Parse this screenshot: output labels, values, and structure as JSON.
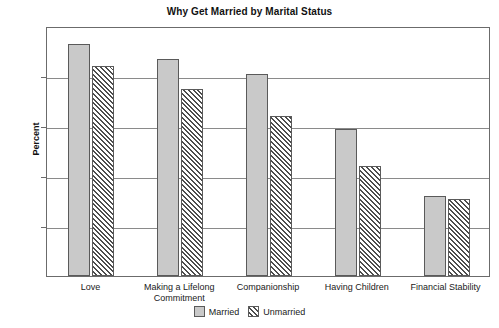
{
  "chart_data": {
    "type": "bar",
    "title": "Why Get Married by Marital Status",
    "xlabel": "",
    "ylabel": "Percent",
    "ylim": [
      0,
      100
    ],
    "yticks": [
      0,
      20,
      40,
      60,
      80,
      100
    ],
    "grid": true,
    "legend_position": "bottom-center",
    "categories": [
      "Love",
      "Making a Lifelong Commitment",
      "Companionship",
      "Having Children",
      "Financial Stability"
    ],
    "series": [
      {
        "name": "Married",
        "values": [
          93,
          87,
          81,
          59,
          32
        ]
      },
      {
        "name": "Unmarried",
        "values": [
          84,
          75,
          64,
          44,
          31
        ]
      }
    ]
  },
  "legend": {
    "items": [
      {
        "label": "Married"
      },
      {
        "label": "Unmarried"
      }
    ]
  }
}
